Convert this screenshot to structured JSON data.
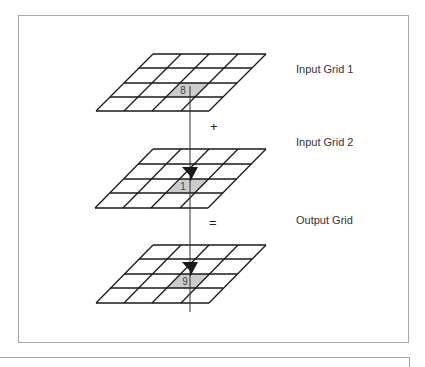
{
  "diagram": {
    "grids": [
      {
        "id": "input-grid-1",
        "label": "Input Grid 1",
        "highlight_value": "8",
        "rows": 4,
        "cols": 4,
        "highlight_row": 2,
        "highlight_col": 2
      },
      {
        "id": "input-grid-2",
        "label": "Input Grid 2",
        "highlight_value": "1",
        "rows": 4,
        "cols": 4,
        "highlight_row": 2,
        "highlight_col": 2
      },
      {
        "id": "output-grid",
        "label": "Output Grid",
        "highlight_value": "9",
        "rows": 4,
        "cols": 4,
        "highlight_row": 2,
        "highlight_col": 2
      }
    ],
    "operators": {
      "plus": "+",
      "equals": "="
    },
    "colors": {
      "grid_line": "#1a1a1a",
      "highlight_fill": "#cccccc",
      "frame": "#a8a8a8",
      "arrow": "#1a1a1a"
    }
  }
}
